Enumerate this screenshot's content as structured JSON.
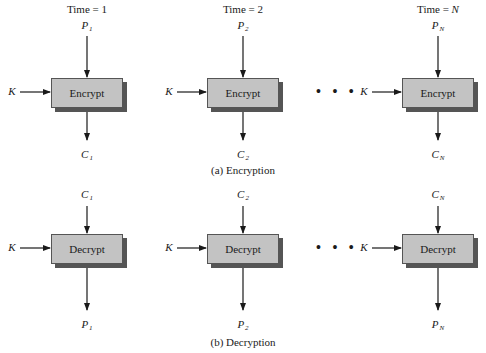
{
  "encryption": {
    "caption": "(a) Encryption",
    "columns": [
      {
        "time_label": "Time = 1",
        "input": "P",
        "input_sub": "1",
        "key": "K",
        "box": "Encrypt",
        "output": "C",
        "output_sub": "1"
      },
      {
        "time_label": "Time = 2",
        "input": "P",
        "input_sub": "2",
        "key": "K",
        "box": "Encrypt",
        "output": "C",
        "output_sub": "2"
      },
      {
        "time_label": "Time = N",
        "input": "P",
        "input_sub": "N",
        "key": "K",
        "box": "Encrypt",
        "output": "C",
        "output_sub": "N"
      }
    ],
    "ellipsis": "• • •"
  },
  "decryption": {
    "caption": "(b) Decryption",
    "columns": [
      {
        "input": "C",
        "input_sub": "1",
        "key": "K",
        "box": "Decrypt",
        "output": "P",
        "output_sub": "1"
      },
      {
        "input": "C",
        "input_sub": "2",
        "key": "K",
        "box": "Decrypt",
        "output": "P",
        "output_sub": "2"
      },
      {
        "input": "C",
        "input_sub": "N",
        "key": "K",
        "box": "Decrypt",
        "output": "P",
        "output_sub": "N"
      }
    ],
    "ellipsis": "• • •"
  },
  "colors": {
    "box_fill": "#c3c3c3",
    "box_shadow": "#555555",
    "line": "#1a1a1a"
  }
}
